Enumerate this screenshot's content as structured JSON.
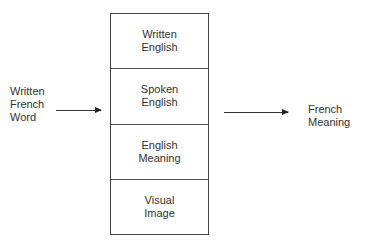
{
  "diagram": {
    "input": {
      "lines": [
        "Written",
        "French",
        "Word"
      ]
    },
    "output": {
      "lines": [
        "French",
        "Meaning"
      ]
    },
    "stack": {
      "cells": [
        {
          "lines": [
            "Written",
            "English"
          ]
        },
        {
          "lines": [
            "Spoken",
            "English"
          ]
        },
        {
          "lines": [
            "English",
            "Meaning"
          ]
        },
        {
          "lines": [
            "Visual",
            "Image"
          ]
        }
      ]
    },
    "arrows": [
      {
        "from": "input",
        "to": "stack"
      },
      {
        "from": "stack",
        "to": "output"
      }
    ]
  }
}
